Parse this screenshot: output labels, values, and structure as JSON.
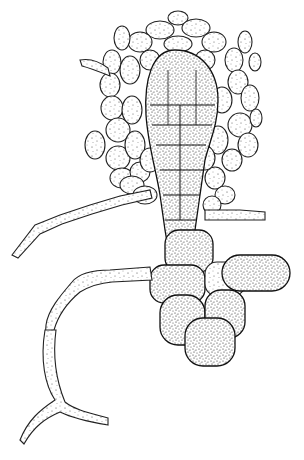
{
  "figure": {
    "background_color": "#ffffff",
    "ink_color": "#222222",
    "dense_stipple_color": "#333333"
  }
}
